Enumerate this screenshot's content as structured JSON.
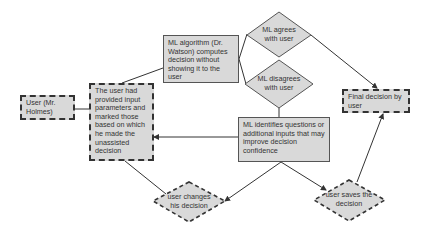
{
  "nodes": {
    "user": {
      "label": "User (Mr. Holmes)"
    },
    "user_params": {
      "label": "The user had provided input parameters and marked those based on which he made the unassisted decision"
    },
    "ml_algorithm": {
      "label": "ML algorithm (Dr. Watson) computes decision without showing it to the user"
    },
    "ml_agrees": {
      "label": "ML agrees with user"
    },
    "ml_disagrees": {
      "label": "ML disagrees with user"
    },
    "ml_identifies": {
      "label": "ML identifies questions or additional inputs that may improve decision confidence"
    },
    "final_decision": {
      "label": "Final decision by user"
    },
    "user_changes": {
      "label": "user changes his decision"
    },
    "user_saves": {
      "label": "user saves the decision"
    }
  },
  "colors": {
    "node_fill": "#d9d9d9",
    "border": "#333333",
    "edge": "#333333"
  }
}
